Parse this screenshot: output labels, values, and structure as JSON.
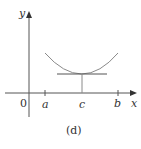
{
  "figure": {
    "caption": "(d)",
    "axes": {
      "x_label": "x",
      "y_label": "y",
      "origin_label": "0"
    },
    "ticks": [
      {
        "label": "a",
        "x": 45
      },
      {
        "label": "c",
        "x": 82
      },
      {
        "label": "b",
        "x": 118
      }
    ],
    "curve": {
      "description": "concave-up curve on [a,b] with minimum at c",
      "color": "#8a8a8a"
    },
    "tangent": {
      "description": "horizontal tangent line at x = c",
      "color": "#555555"
    }
  }
}
